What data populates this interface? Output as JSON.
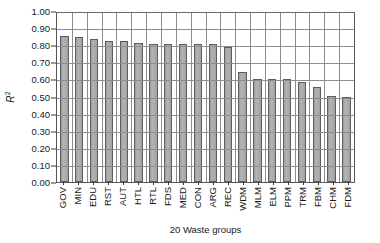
{
  "chart_data": {
    "type": "bar",
    "title": "",
    "xlabel": "20 Waste groups",
    "ylabel": "R²",
    "ylim": [
      0.0,
      1.0
    ],
    "ytick_step": 0.1,
    "grid": true,
    "legend": "none",
    "categories": [
      "GOV",
      "MIN",
      "EDU",
      "RST",
      "AUT",
      "HTL",
      "RTL",
      "FDS",
      "MED",
      "CON",
      "ARG",
      "REC",
      "WDM",
      "MLM",
      "ELM",
      "PPM",
      "TRM",
      "FBM",
      "CHM",
      "FDM"
    ],
    "values": [
      0.855,
      0.85,
      0.835,
      0.825,
      0.825,
      0.815,
      0.805,
      0.805,
      0.805,
      0.805,
      0.805,
      0.79,
      0.645,
      0.605,
      0.6,
      0.6,
      0.585,
      0.555,
      0.505,
      0.5
    ],
    "ytick_labels": [
      "1.00",
      "0.90",
      "0.80",
      "0.70",
      "0.60",
      "0.50",
      "0.40",
      "0.30",
      "0.20",
      "0.10",
      "0.00"
    ],
    "bar_color": "#a9a9a9",
    "bar_border_color": "#5d5d5d",
    "grid_color": "#8d8d8d",
    "axis_color": "#565656",
    "background": "#ffffff"
  }
}
